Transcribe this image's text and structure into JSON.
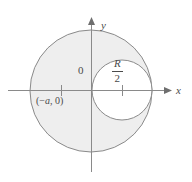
{
  "figure": {
    "background_color": "#ffffff",
    "axes": {
      "x_axis_label": "x",
      "y_axis_label": "y",
      "origin_label": "0",
      "axis_color": "#808080",
      "x_axis_start_px": 8,
      "x_axis_end_px": 168,
      "y_axis_top_px": 18,
      "y_axis_bottom_px": 172,
      "origin_px": [
        91,
        90
      ]
    },
    "shapes": {
      "outer_circle": {
        "name": "large-shaded-circle",
        "center_px": [
          91,
          91
        ],
        "radius_px": 61,
        "fill_color": "#eeeeee",
        "stroke_color": "#808080",
        "stroke_width": 1
      },
      "inner_circle": {
        "name": "small-unshaded-circle",
        "center_px": [
          122,
          90
        ],
        "radius_px": 30,
        "fill_color": "#ffffff",
        "stroke_color": "#808080",
        "stroke_width": 1
      }
    },
    "ticks": [
      {
        "name": "tick-minus-a",
        "x_px": 61,
        "label": "(−a, 0)"
      },
      {
        "name": "tick-radius-half",
        "x_px": 122,
        "label": "R/2"
      }
    ],
    "labels": {
      "point_a": {
        "open_paren": "(",
        "minus": "−",
        "variable": "a",
        "comma": ", ",
        "zero": "0",
        "close_paren": ")",
        "full_text": "(−a, 0)"
      },
      "radius_fraction": {
        "numerator": "R",
        "denominator": "2",
        "full_text": "R/2"
      }
    }
  }
}
